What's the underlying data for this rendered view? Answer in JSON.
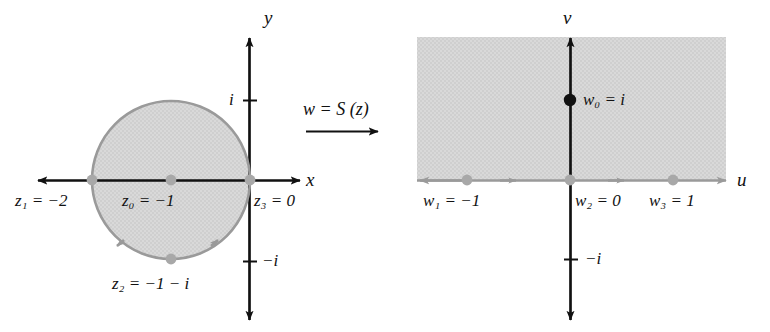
{
  "figure": {
    "colors": {
      "axis": "#111111",
      "shade_fill": "#d6d6d6",
      "circle_stroke": "#9a9a9a",
      "gray_point": "#a8a8a8",
      "black_point": "#111111",
      "gray_arrow": "#9a9a9a",
      "background": "#ffffff"
    }
  },
  "z_plane": {
    "axis_x_label": "x",
    "axis_y_label": "y",
    "tick_i_label": "i",
    "tick_minus_i_label": "−i",
    "points": [
      {
        "name": "z1",
        "sub": "1",
        "value": "−2",
        "label": "z₁ = −2",
        "kind": "gray"
      },
      {
        "name": "z0",
        "sub": "0",
        "value": "−1",
        "label": "z₀ = −1",
        "kind": "gray"
      },
      {
        "name": "z3",
        "sub": "3",
        "value": "0",
        "label": "z₃ = 0",
        "kind": "gray"
      },
      {
        "name": "z2",
        "sub": "2",
        "value": "−1 − i",
        "label": "z₂ = −1 − i",
        "kind": "gray"
      }
    ],
    "region": "shaded disk of radius 1 centered at −1, boundary traversed counterclockwise"
  },
  "mapping": {
    "label_w": "w",
    "label_eq": "=",
    "label_S": "S",
    "label_arg": "(z)",
    "full": "w = S (z)",
    "arrow": "right-arrow"
  },
  "w_plane": {
    "axis_u_label": "u",
    "axis_v_label": "v",
    "tick_minus_i_label": "−i",
    "points": [
      {
        "name": "w1",
        "sub": "1",
        "value": "−1",
        "label": "w₁ = −1",
        "kind": "gray"
      },
      {
        "name": "w2",
        "sub": "2",
        "value": "0",
        "label": "w₂ = 0",
        "kind": "gray"
      },
      {
        "name": "w3",
        "sub": "3",
        "value": "1",
        "label": "w₃ = 1",
        "kind": "gray"
      },
      {
        "name": "w0",
        "sub": "0",
        "value": "i",
        "label": "w₀ = i",
        "kind": "black"
      }
    ],
    "region": "shaded upper half plane, real axis traversed to the right"
  }
}
